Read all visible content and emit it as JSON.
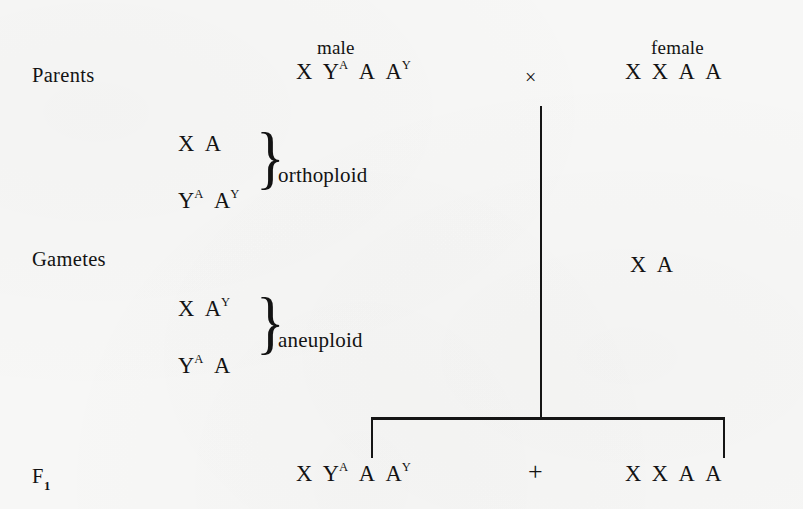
{
  "figure": {
    "type": "genetic-cross-diagram",
    "ink_color": "#131313",
    "background_color": "#f7f7f6"
  },
  "rows": {
    "parents_label": "Parents",
    "gametes_label": "Gametes",
    "f1_label_base": "F",
    "f1_label_sub": "1"
  },
  "headers": {
    "male": "male",
    "female": "female"
  },
  "parents": {
    "male_genotype": {
      "parts": [
        {
          "base": "X",
          "sup": ""
        },
        {
          "base": "Y",
          "sup": "A"
        },
        {
          "base": "A",
          "sup": ""
        },
        {
          "base": "A",
          "sup": "Y"
        }
      ],
      "plain": "X YA A AY"
    },
    "cross_operator": "×",
    "female_genotype": {
      "parts": [
        {
          "base": "X",
          "sup": ""
        },
        {
          "base": "X",
          "sup": ""
        },
        {
          "base": "A",
          "sup": ""
        },
        {
          "base": "A",
          "sup": ""
        }
      ],
      "plain": "X X A A"
    }
  },
  "gametes": {
    "male_groups": [
      {
        "name": "orthoploid",
        "label": "orthoploid",
        "brace": "}",
        "lines": [
          {
            "parts": [
              {
                "base": "X",
                "sup": ""
              },
              {
                "base": "A",
                "sup": ""
              }
            ],
            "plain": "X A"
          },
          {
            "parts": [
              {
                "base": "Y",
                "sup": "A"
              },
              {
                "base": "A",
                "sup": "Y"
              }
            ],
            "plain": "YA AY"
          }
        ]
      },
      {
        "name": "aneuploid",
        "label": "aneuploid",
        "brace": "}",
        "lines": [
          {
            "parts": [
              {
                "base": "X",
                "sup": ""
              },
              {
                "base": "A",
                "sup": "Y"
              }
            ],
            "plain": "X AY"
          },
          {
            "parts": [
              {
                "base": "Y",
                "sup": "A"
              },
              {
                "base": "A",
                "sup": ""
              }
            ],
            "plain": "YA A"
          }
        ]
      }
    ],
    "female_gamete": {
      "parts": [
        {
          "base": "X",
          "sup": ""
        },
        {
          "base": "A",
          "sup": ""
        }
      ],
      "plain": "X A"
    }
  },
  "f1": {
    "left_genotype": {
      "parts": [
        {
          "base": "X",
          "sup": ""
        },
        {
          "base": "Y",
          "sup": "A"
        },
        {
          "base": "A",
          "sup": ""
        },
        {
          "base": "A",
          "sup": "Y"
        }
      ],
      "plain": "X YA A AY"
    },
    "plus_operator": "+",
    "right_genotype": {
      "parts": [
        {
          "base": "X",
          "sup": ""
        },
        {
          "base": "X",
          "sup": ""
        },
        {
          "base": "A",
          "sup": ""
        },
        {
          "base": "A",
          "sup": ""
        }
      ],
      "plain": "X X A A"
    }
  }
}
